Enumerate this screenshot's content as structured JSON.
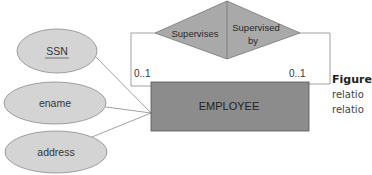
{
  "diagram": {
    "type": "ER diagram (unary/recursive relationship)",
    "entity": {
      "name": "EMPLOYEE",
      "fill": "#8c8c8c"
    },
    "attributes": [
      {
        "name": "SSN",
        "key": true
      },
      {
        "name": "ename",
        "key": false
      },
      {
        "name": "address",
        "key": false
      }
    ],
    "attribute_fill": "#d4d4d4",
    "relationship": {
      "roles": [
        {
          "label": "Supervises"
        },
        {
          "label_line1": "Supervised",
          "label_line2": "by"
        }
      ],
      "fill": "#a9a9a9"
    },
    "cardinalities": {
      "left": "0..1",
      "right": "0..1"
    },
    "caption": {
      "title": "Figure",
      "line1": "relatio",
      "line2": "relatio"
    }
  }
}
